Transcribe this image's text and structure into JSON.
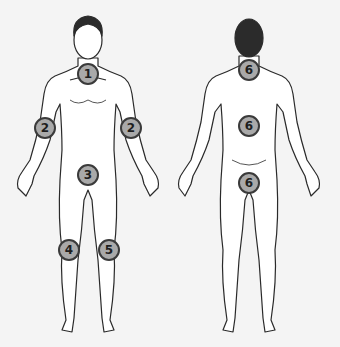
{
  "diagram": {
    "colors": {
      "background": "#f4f4f4",
      "skin": "#ffffff",
      "outline": "#2a2a2a",
      "hair": "#2b2b2b",
      "badge_fill": "#a9a9a9",
      "badge_border": "#3a3a3a"
    },
    "front_view": {
      "markers": [
        {
          "label": "1",
          "site": "neck-front",
          "x": 88,
          "y": 74
        },
        {
          "label": "2",
          "site": "right-upper-arm",
          "x": 45,
          "y": 128
        },
        {
          "label": "2",
          "site": "left-upper-arm",
          "x": 131,
          "y": 128
        },
        {
          "label": "3",
          "site": "groin",
          "x": 88,
          "y": 175
        },
        {
          "label": "4",
          "site": "right-knee",
          "x": 69,
          "y": 250
        },
        {
          "label": "5",
          "site": "left-knee",
          "x": 109,
          "y": 250
        }
      ]
    },
    "back_view": {
      "markers": [
        {
          "label": "6",
          "site": "back-of-neck",
          "x": 249,
          "y": 70
        },
        {
          "label": "6",
          "site": "lower-back",
          "x": 249,
          "y": 126
        },
        {
          "label": "6",
          "site": "buttocks",
          "x": 249,
          "y": 183
        }
      ]
    }
  }
}
